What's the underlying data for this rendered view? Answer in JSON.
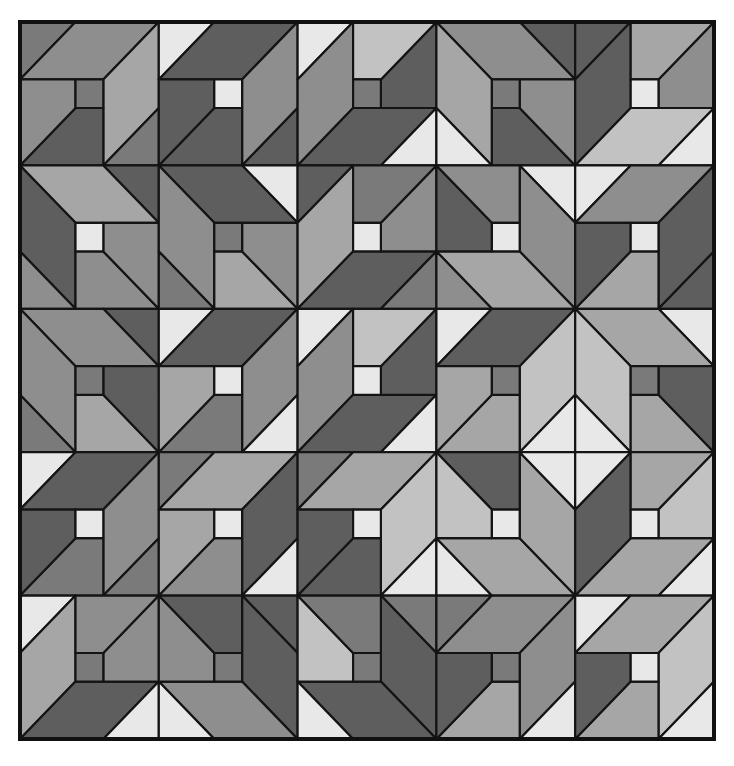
{
  "figure": {
    "kind": "geometric quilt pattern",
    "grid": {
      "rows": 5,
      "cols": 5,
      "left": 20,
      "top": 22,
      "width": 694,
      "height": 717
    },
    "palette": {
      "D": "#5e5e5e",
      "M": "#7a7a7a",
      "G": "#8e8e8e",
      "L": "#a6a6a6",
      "P": "#c2c2c2",
      "W": "#e8e8e8",
      "line": "#141414",
      "background": "#ffffff"
    },
    "template_pieces": {
      "triA": [
        [
          0,
          0
        ],
        [
          0.4,
          0
        ],
        [
          0,
          0.4
        ]
      ],
      "P1": [
        [
          0.4,
          0
        ],
        [
          1,
          0
        ],
        [
          0.6,
          0.4
        ],
        [
          0,
          0.4
        ]
      ],
      "P2": [
        [
          1,
          0
        ],
        [
          1,
          0.6
        ],
        [
          0.6,
          1
        ],
        [
          0.6,
          0.4
        ]
      ],
      "triB": [
        [
          1,
          0.6
        ],
        [
          1,
          1
        ],
        [
          0.6,
          1
        ]
      ],
      "Z1": [
        [
          0.6,
          1
        ],
        [
          0,
          1
        ],
        [
          0.4,
          0.6
        ],
        [
          0.6,
          0.6
        ]
      ],
      "Z2": [
        [
          0,
          0.4
        ],
        [
          0.4,
          0.4
        ],
        [
          0.4,
          0.6
        ],
        [
          0,
          1
        ]
      ],
      "center": [
        [
          0.4,
          0.4
        ],
        [
          0.6,
          0.4
        ],
        [
          0.6,
          0.6
        ],
        [
          0.4,
          0.6
        ]
      ]
    },
    "slot_order": [
      "triA",
      "P1",
      "P2",
      "triB",
      "Z1",
      "Z2",
      "center"
    ],
    "blocks": [
      [
        {
          "t": "I",
          "c": [
            "M",
            "G",
            "L",
            "M",
            "D",
            "G",
            "M"
          ]
        },
        {
          "t": "I",
          "c": [
            "W",
            "D",
            "G",
            "D",
            "D",
            "D",
            "W"
          ]
        },
        {
          "t": "T",
          "c": [
            "W",
            "G",
            "D",
            "W",
            "D",
            "P",
            "M"
          ]
        },
        {
          "t": "H",
          "c": [
            "D",
            "G",
            "L",
            "W",
            "D",
            "G",
            "M"
          ]
        },
        {
          "t": "T",
          "c": [
            "D",
            "D",
            "P",
            "W",
            "G",
            "L",
            "W"
          ]
        }
      ],
      [
        {
          "t": "H",
          "c": [
            "D",
            "L",
            "D",
            "G",
            "G",
            "G",
            "W"
          ]
        },
        {
          "t": "H",
          "c": [
            "W",
            "D",
            "G",
            "M",
            "L",
            "G",
            "M"
          ]
        },
        {
          "t": "T",
          "c": [
            "D",
            "L",
            "D",
            "M",
            "G",
            "M",
            "W"
          ]
        },
        {
          "t": "TH",
          "c": [
            "W",
            "G",
            "L",
            "G",
            "D",
            "G",
            "W"
          ]
        },
        {
          "t": "I",
          "c": [
            "W",
            "G",
            "D",
            "D",
            "L",
            "D",
            "W"
          ]
        }
      ],
      [
        {
          "t": "H",
          "c": [
            "D",
            "G",
            "G",
            "M",
            "L",
            "D",
            "M"
          ]
        },
        {
          "t": "I",
          "c": [
            "W",
            "D",
            "G",
            "W",
            "M",
            "L",
            "W"
          ]
        },
        {
          "t": "T",
          "c": [
            "W",
            "G",
            "D",
            "W",
            "D",
            "P",
            "W"
          ]
        },
        {
          "t": "I",
          "c": [
            "W",
            "D",
            "P",
            "W",
            "L",
            "L",
            "M"
          ]
        },
        {
          "t": "H",
          "c": [
            "W",
            "L",
            "P",
            "W",
            "L",
            "D",
            "M"
          ]
        }
      ],
      [
        {
          "t": "I",
          "c": [
            "W",
            "D",
            "G",
            "M",
            "M",
            "D",
            "W"
          ]
        },
        {
          "t": "I",
          "c": [
            "M",
            "L",
            "D",
            "W",
            "G",
            "L",
            "W"
          ]
        },
        {
          "t": "I",
          "c": [
            "M",
            "L",
            "P",
            "W",
            "D",
            "D",
            "W"
          ]
        },
        {
          "t": "V",
          "c": [
            "W",
            "L",
            "L",
            "W",
            "D",
            "P",
            "W"
          ]
        },
        {
          "t": "HV",
          "c": [
            "W",
            "L",
            "D",
            "W",
            "L",
            "P",
            "W"
          ]
        }
      ],
      [
        {
          "t": "T",
          "c": [
            "W",
            "L",
            "D",
            "W",
            "G",
            "G",
            "M"
          ]
        },
        {
          "t": "TH",
          "c": [
            "D",
            "D",
            "G",
            "W",
            "G",
            "D",
            "M"
          ]
        },
        {
          "t": "TH",
          "c": [
            "M",
            "D",
            "D",
            "W",
            "P",
            "M",
            "M"
          ]
        },
        {
          "t": "I",
          "c": [
            "M",
            "G",
            "G",
            "W",
            "L",
            "D",
            "M"
          ]
        },
        {
          "t": "I",
          "c": [
            "W",
            "L",
            "P",
            "W",
            "L",
            "D",
            "W"
          ]
        }
      ]
    ]
  }
}
